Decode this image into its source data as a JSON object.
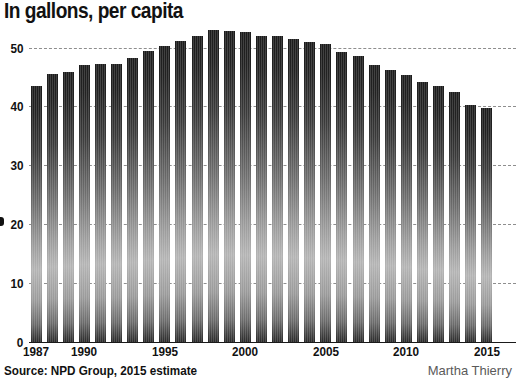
{
  "chart_data": {
    "type": "bar",
    "title": "In gallons, per capita",
    "subtitle": "",
    "xlabel": "",
    "ylabel": "",
    "ylim": [
      0,
      54
    ],
    "xlim": [
      1986.5,
      2015.5
    ],
    "grid": true,
    "grid_style": "dashed horizontal",
    "legend": null,
    "y_ticks": [
      0,
      10,
      20,
      30,
      40,
      50
    ],
    "y_tick_labels": [
      "0",
      "10",
      "20",
      "30",
      "40",
      "50"
    ],
    "x_ticks": [
      1987,
      1990,
      1995,
      2000,
      2005,
      2010,
      2015
    ],
    "x_tick_labels": [
      "1987",
      "1990",
      "1995",
      "2000",
      "2005",
      "2010",
      "2015"
    ],
    "categories": [
      "1987",
      "1988",
      "1989",
      "1990",
      "1991",
      "1992",
      "1993",
      "1994",
      "1995",
      "1996",
      "1997",
      "1998",
      "1999",
      "2000",
      "2001",
      "2002",
      "2003",
      "2004",
      "2005",
      "2006",
      "2007",
      "2008",
      "2009",
      "2010",
      "2011",
      "2012",
      "2013",
      "2014",
      "2015"
    ],
    "values": [
      43.5,
      45.5,
      45.8,
      47.0,
      47.2,
      47.2,
      48.3,
      49.5,
      50.3,
      51.2,
      52.0,
      53.0,
      52.8,
      52.6,
      52.0,
      52.0,
      51.5,
      51.0,
      50.6,
      49.3,
      48.5,
      47.0,
      46.2,
      45.3,
      44.2,
      43.4,
      42.5,
      40.3,
      39.8
    ],
    "bar_fill": "#4a4a4a",
    "bar_gradient": [
      "#1c1c1c",
      "#b4b4b4",
      "#2a2a2a"
    ],
    "gridline_color": "#8e8e8e",
    "axis_color": "#1a1a1a"
  },
  "footer": {
    "source": "Source: NPD Group, 2015 estimate",
    "credit": "Martha Thierry"
  }
}
